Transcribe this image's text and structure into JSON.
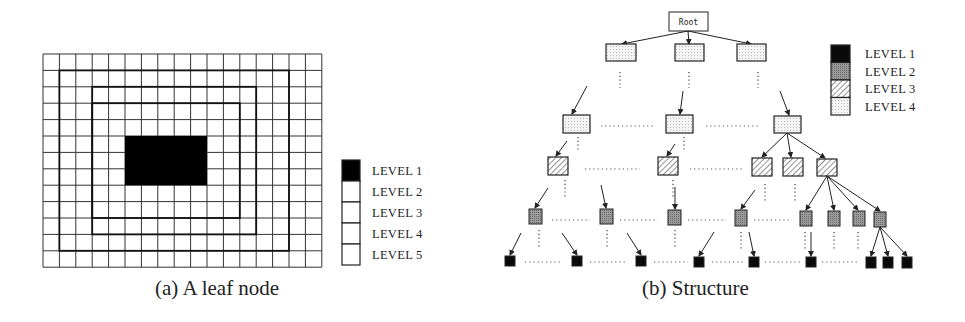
{
  "panel_a": {
    "caption": "(a) A leaf node",
    "grid": {
      "cols": 17,
      "rows": 13,
      "x": 43,
      "y": 54,
      "cell": 16.4
    },
    "level1_block": {
      "col": 5,
      "row": 5,
      "w": 5,
      "h": 3
    },
    "level_borders": [
      {
        "level": 2,
        "col": 3,
        "row": 3,
        "w": 9,
        "h": 7
      },
      {
        "level": 3,
        "col": 3,
        "row": 2,
        "w": 10,
        "h": 9
      },
      {
        "level": 4,
        "col": 1,
        "row": 1,
        "w": 14,
        "h": 11
      }
    ],
    "legend": [
      {
        "label": "LEVEL 1",
        "fill": "black"
      },
      {
        "label": "LEVEL 2",
        "fill": "white"
      },
      {
        "label": "LEVEL 3",
        "fill": "white"
      },
      {
        "label": "LEVEL 4",
        "fill": "white"
      },
      {
        "label": "LEVEL 5",
        "fill": "white"
      }
    ]
  },
  "panel_b": {
    "caption": "(b) Structure",
    "root_label": "Root",
    "legend": [
      {
        "label": "LEVEL 1",
        "fill": "black"
      },
      {
        "label": "LEVEL 2",
        "fill": "gray"
      },
      {
        "label": "LEVEL 3",
        "fill": "hatched"
      },
      {
        "label": "LEVEL 4",
        "fill": "dotted"
      }
    ],
    "nodes": {
      "level5": [
        {
          "x": 606,
          "y": 44,
          "w": 30,
          "h": 17
        },
        {
          "x": 675,
          "y": 44,
          "w": 29,
          "h": 17
        },
        {
          "x": 737,
          "y": 44,
          "w": 29,
          "h": 17
        }
      ],
      "level4": [
        {
          "x": 563,
          "y": 115,
          "w": 27,
          "h": 18
        },
        {
          "x": 666,
          "y": 115,
          "w": 27,
          "h": 18
        },
        {
          "x": 774,
          "y": 116,
          "w": 27,
          "h": 17
        }
      ],
      "level3": [
        {
          "x": 548,
          "y": 157,
          "w": 20,
          "h": 18
        },
        {
          "x": 658,
          "y": 157,
          "w": 20,
          "h": 18
        },
        {
          "x": 752,
          "y": 158,
          "w": 20,
          "h": 18
        },
        {
          "x": 783,
          "y": 158,
          "w": 20,
          "h": 18
        },
        {
          "x": 817,
          "y": 159,
          "w": 20,
          "h": 17
        }
      ],
      "level2": [
        {
          "x": 529,
          "y": 209,
          "w": 13,
          "h": 15
        },
        {
          "x": 600,
          "y": 209,
          "w": 13,
          "h": 15
        },
        {
          "x": 668,
          "y": 210,
          "w": 13,
          "h": 15
        },
        {
          "x": 735,
          "y": 210,
          "w": 12,
          "h": 16
        },
        {
          "x": 800,
          "y": 211,
          "w": 12,
          "h": 15
        },
        {
          "x": 828,
          "y": 211,
          "w": 12,
          "h": 15
        },
        {
          "x": 853,
          "y": 211,
          "w": 12,
          "h": 15
        },
        {
          "x": 874,
          "y": 212,
          "w": 12,
          "h": 15
        }
      ],
      "level1": [
        {
          "x": 505,
          "y": 256,
          "w": 10,
          "h": 10
        },
        {
          "x": 572,
          "y": 256,
          "w": 10,
          "h": 10
        },
        {
          "x": 636,
          "y": 256,
          "w": 10,
          "h": 10
        },
        {
          "x": 694,
          "y": 257,
          "w": 10,
          "h": 10
        },
        {
          "x": 749,
          "y": 257,
          "w": 10,
          "h": 10
        },
        {
          "x": 806,
          "y": 257,
          "w": 10,
          "h": 10
        },
        {
          "x": 866,
          "y": 257,
          "w": 10,
          "h": 11
        },
        {
          "x": 883,
          "y": 257,
          "w": 10,
          "h": 11
        },
        {
          "x": 902,
          "y": 257,
          "w": 10,
          "h": 11
        }
      ]
    }
  }
}
